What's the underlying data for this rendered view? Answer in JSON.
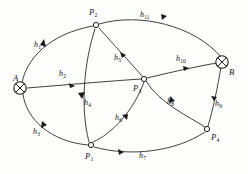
{
  "diagram": {
    "kind": "directed-graph",
    "title": "",
    "background_color": "#fdfdfc",
    "stroke_color": "#2b2b2b",
    "label_color": "#141414",
    "nodes": [
      {
        "id": "A",
        "label": "A",
        "type": "terminal",
        "x": 20,
        "y": 88,
        "label_x": 13,
        "label_y": 74
      },
      {
        "id": "B",
        "label": "B",
        "type": "terminal",
        "x": 222,
        "y": 62,
        "label_x": 229,
        "label_y": 68
      },
      {
        "id": "P1",
        "label": "P",
        "sub": "1",
        "type": "interior",
        "x": 91,
        "y": 145,
        "label_x": 85,
        "label_y": 152
      },
      {
        "id": "P2",
        "label": "P",
        "sub": "2",
        "type": "interior",
        "x": 96,
        "y": 25,
        "label_x": 89,
        "label_y": 10
      },
      {
        "id": "P3",
        "label": "P",
        "sub": "3",
        "type": "interior",
        "x": 144,
        "y": 79,
        "label_x": 133,
        "label_y": 84
      },
      {
        "id": "P4",
        "label": "P",
        "sub": "4",
        "type": "interior",
        "x": 207,
        "y": 129,
        "label_x": 211,
        "label_y": 133
      }
    ],
    "edges": [
      {
        "id": "h1",
        "label": "h",
        "sub": "1",
        "from": "A",
        "to": "P2",
        "label_x": 34,
        "label_y": 41
      },
      {
        "id": "h2",
        "label": "h",
        "sub": "2",
        "from": "A",
        "to": "P3",
        "label_x": 59,
        "label_y": 70
      },
      {
        "id": "h3",
        "label": "h",
        "sub": "3",
        "from": "A",
        "to": "P1",
        "label_x": 33,
        "label_y": 128
      },
      {
        "id": "h4",
        "label": "h",
        "sub": "4",
        "from": "P2",
        "to": "P1",
        "label_x": 83,
        "label_y": 98
      },
      {
        "id": "h5",
        "label": "h",
        "sub": "5",
        "from": "P2",
        "to": "P3",
        "label_x": 114,
        "label_y": 54
      },
      {
        "id": "h6",
        "label": "h",
        "sub": "6",
        "from": "P1",
        "to": "P3",
        "label_x": 116,
        "label_y": 114
      },
      {
        "id": "h7",
        "label": "h",
        "sub": "7",
        "from": "P1",
        "to": "P4",
        "label_x": 139,
        "label_y": 152
      },
      {
        "id": "h8",
        "label": "h",
        "sub": "8",
        "from": "P4",
        "to": "P3",
        "label_x": 168,
        "label_y": 98
      },
      {
        "id": "h9",
        "label": "h",
        "sub": "9",
        "from": "P4",
        "to": "B",
        "label_x": 215,
        "label_y": 101
      },
      {
        "id": "h10",
        "label": "h",
        "sub": "10",
        "from": "P3",
        "to": "B",
        "label_x": 177,
        "label_y": 56
      },
      {
        "id": "h11",
        "label": "h",
        "sub": "11",
        "from": "P2",
        "to": "B",
        "label_x": 141,
        "label_y": 12
      }
    ]
  }
}
